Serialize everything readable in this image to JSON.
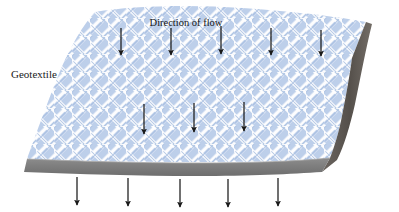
{
  "figure": {
    "type": "technical-illustration",
    "labels": {
      "geotextile": "Geotextile",
      "direction_of_flow": "Direction of flow"
    },
    "colors": {
      "fabric_base": "#b8cce8",
      "fabric_weave": "#ffffff",
      "fabric_weave_shadow": "#9fb8dd",
      "edge_gray": "#808080",
      "edge_gray_dark": "#5a5550",
      "arrow": "#1a1a1a",
      "background": "#ffffff"
    },
    "arrows": {
      "row_top": {
        "count": 5,
        "y_start": 28,
        "y_end": 55,
        "x_positions": [
          121,
          171,
          221,
          271,
          321
        ]
      },
      "row_middle": {
        "count": 3,
        "y_start": 103,
        "y_end": 134,
        "x_positions": [
          144,
          194,
          244
        ]
      },
      "row_below": {
        "count": 5,
        "y_start": 176,
        "y_end": 205,
        "x_positions": [
          77,
          128,
          180,
          228,
          278
        ]
      }
    },
    "slab": {
      "description": "woven geotextile sheet in parallelogram perspective with torn right edge and gray thickness band along bottom",
      "top_edge_left_x": 95,
      "top_edge_right_x": 368,
      "bottom_edge_left_x": 24,
      "bottom_edge_right_x": 322
    }
  }
}
